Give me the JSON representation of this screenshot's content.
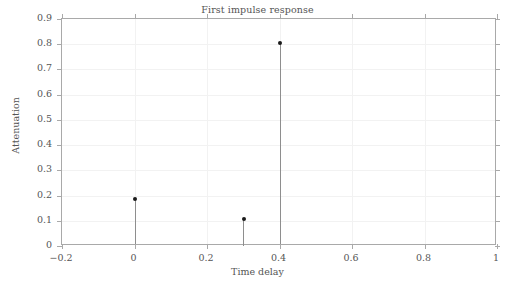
{
  "chart_data": {
    "type": "scatter",
    "title": "First impulse response",
    "xlabel": "Time delay",
    "ylabel": "Attenuation",
    "xlim": [
      -0.2,
      1
    ],
    "ylim": [
      0,
      0.9
    ],
    "grid": true,
    "legend": null,
    "style": "stem",
    "x": [
      0,
      0.3,
      0.4
    ],
    "values": [
      0.188,
      0.107,
      0.805
    ],
    "series": [
      {
        "name": "impulse response",
        "points": [
          {
            "x": 0,
            "y": 0.188
          },
          {
            "x": 0.3,
            "y": 0.107
          },
          {
            "x": 0.4,
            "y": 0.805
          }
        ]
      }
    ],
    "xticks": [
      -0.2,
      0,
      0.2,
      0.4,
      0.6,
      0.8,
      1
    ],
    "xtick_labels": [
      "−0.2",
      "0",
      "0.2",
      "0.4",
      "0.6",
      "0.8",
      "1"
    ],
    "yticks": [
      0,
      0.1,
      0.2,
      0.3,
      0.4,
      0.5,
      0.6,
      0.7,
      0.8,
      0.9
    ],
    "ytick_labels": [
      "0",
      "0.1",
      "0.2",
      "0.3",
      "0.4",
      "0.5",
      "0.6",
      "0.7",
      "0.8",
      "0.9"
    ],
    "colors": {
      "marker": "#1a1a1a",
      "stem": "#8e8e8e",
      "axis": "#a9a9a9",
      "grid": "#f2f2f2",
      "text": "#555555",
      "background": "#ffffff"
    }
  }
}
